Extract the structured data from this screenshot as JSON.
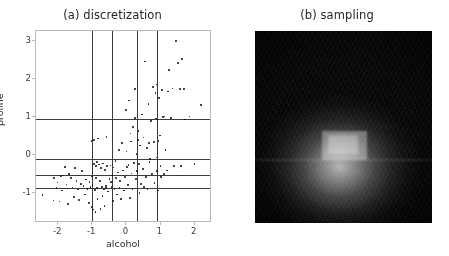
{
  "figure": {
    "width": 449,
    "height": 256,
    "background": "#ffffff"
  },
  "chart_data": [
    {
      "type": "scatter",
      "panel": "a",
      "title": "(a) discretization",
      "xlabel": "alcohol",
      "ylabel": "proline",
      "xlim": [
        -2.65,
        2.45
      ],
      "ylim": [
        -1.75,
        3.25
      ],
      "xticks": [
        -2,
        -1,
        0,
        1,
        2
      ],
      "xticklabels": [
        "-2",
        "-1",
        "0",
        "1",
        "2"
      ],
      "yticks": [
        -1,
        0,
        1,
        2,
        3
      ],
      "yticklabels": [
        "-1",
        "0",
        "1",
        "2",
        "3"
      ],
      "grid": false,
      "legend": null,
      "marker_color": "#111111",
      "marker_size": 1.8,
      "discretization_lines": {
        "vertical_x": [
          -1.0,
          -0.43,
          0.3,
          0.9
        ],
        "horizontal_y": [
          0.93,
          -0.13,
          -0.53,
          -0.87
        ],
        "color": "#3b3b3b"
      },
      "points": [
        [
          -2.46,
          -1.06
        ],
        [
          -2.14,
          -1.21
        ],
        [
          -2.12,
          -0.62
        ],
        [
          -2.05,
          -0.88
        ],
        [
          -2.02,
          -0.74
        ],
        [
          -1.96,
          -1.24
        ],
        [
          -1.92,
          -0.57
        ],
        [
          -1.88,
          -0.95
        ],
        [
          -1.84,
          -0.55
        ],
        [
          -1.8,
          -0.33
        ],
        [
          -1.76,
          -0.79
        ],
        [
          -1.72,
          -1.31
        ],
        [
          -1.68,
          -0.52
        ],
        [
          -1.62,
          -0.61
        ],
        [
          -1.58,
          -0.87
        ],
        [
          -1.54,
          -1.12
        ],
        [
          -1.5,
          -0.35
        ],
        [
          -1.46,
          -0.7
        ],
        [
          -1.42,
          -0.92
        ],
        [
          -1.38,
          -1.2
        ],
        [
          -1.34,
          -0.78
        ],
        [
          -1.3,
          -0.44
        ],
        [
          -1.26,
          -0.83
        ],
        [
          -1.22,
          -1.05
        ],
        [
          -1.18,
          -0.66
        ],
        [
          -1.14,
          -0.9
        ],
        [
          -1.1,
          -1.28
        ],
        [
          -1.08,
          -0.72
        ],
        [
          -1.05,
          -0.86
        ],
        [
          -1.02,
          -1.38
        ],
        [
          -1.0,
          -0.58
        ],
        [
          -0.99,
          -0.81
        ],
        [
          -0.98,
          -1.45
        ],
        [
          -0.96,
          0.38
        ],
        [
          -0.95,
          -0.25
        ],
        [
          -0.93,
          -0.94
        ],
        [
          -0.91,
          -1.52
        ],
        [
          -0.89,
          -0.3
        ],
        [
          -0.87,
          -0.88
        ],
        [
          -0.85,
          -1.18
        ],
        [
          -0.83,
          0.42
        ],
        [
          -0.8,
          -0.26
        ],
        [
          -0.78,
          -0.69
        ],
        [
          -0.76,
          -1.44
        ],
        [
          -0.74,
          -0.36
        ],
        [
          -0.72,
          -0.85
        ],
        [
          -0.7,
          -1.1
        ],
        [
          -0.68,
          -0.24
        ],
        [
          -0.66,
          -0.92
        ],
        [
          -0.64,
          -1.35
        ],
        [
          -0.62,
          -0.41
        ],
        [
          -0.6,
          -0.88
        ],
        [
          -0.58,
          0.46
        ],
        [
          -0.56,
          -0.31
        ],
        [
          -0.54,
          -0.97
        ],
        [
          -0.5,
          -0.64
        ],
        [
          -0.47,
          -0.29
        ],
        [
          -0.44,
          -0.86
        ],
        [
          -0.42,
          -0.55
        ],
        [
          -0.4,
          -1.22
        ],
        [
          -0.38,
          -0.34
        ],
        [
          -0.35,
          -0.92
        ],
        [
          -0.32,
          -0.18
        ],
        [
          -0.3,
          -0.62
        ],
        [
          -0.28,
          -1.05
        ],
        [
          -0.25,
          -0.47
        ],
        [
          -0.22,
          0.12
        ],
        [
          -0.2,
          -0.88
        ],
        [
          -0.18,
          -0.7
        ],
        [
          -0.15,
          -1.17
        ],
        [
          -0.12,
          0.3
        ],
        [
          -0.1,
          -0.42
        ],
        [
          -0.08,
          -0.95
        ],
        [
          -0.05,
          -0.6
        ],
        [
          -0.02,
          1.18
        ],
        [
          0.0,
          0.08
        ],
        [
          0.02,
          -0.33
        ],
        [
          0.05,
          -0.8
        ],
        [
          0.08,
          1.42
        ],
        [
          0.1,
          -1.15
        ],
        [
          0.12,
          0.55
        ],
        [
          0.15,
          -0.5
        ],
        [
          0.18,
          -0.92
        ],
        [
          0.2,
          0.72
        ],
        [
          0.22,
          -0.22
        ],
        [
          0.25,
          1.72
        ],
        [
          0.26,
          0.96
        ],
        [
          0.28,
          -0.65
        ],
        [
          0.3,
          0.02
        ],
        [
          0.32,
          -0.44
        ],
        [
          0.35,
          0.62
        ],
        [
          0.38,
          -1.02
        ],
        [
          0.4,
          0.24
        ],
        [
          0.42,
          -0.78
        ],
        [
          0.45,
          1.05
        ],
        [
          0.48,
          -0.38
        ],
        [
          0.5,
          0.45
        ],
        [
          0.55,
          2.45
        ],
        [
          0.58,
          -0.6
        ],
        [
          0.6,
          0.18
        ],
        [
          0.62,
          -0.9
        ],
        [
          0.65,
          1.32
        ],
        [
          0.68,
          -0.2
        ],
        [
          0.72,
          0.88
        ],
        [
          0.75,
          -0.52
        ],
        [
          0.78,
          1.78
        ],
        [
          0.8,
          0.33
        ],
        [
          0.82,
          -0.75
        ],
        [
          0.85,
          1.62
        ],
        [
          0.86,
          0.95
        ],
        [
          0.88,
          -0.08
        ],
        [
          0.9,
          1.84
        ],
        [
          0.9,
          -0.44
        ],
        [
          0.91,
          0.92
        ],
        [
          0.92,
          -0.95
        ],
        [
          0.95,
          1.48
        ],
        [
          0.98,
          0.5
        ],
        [
          1.0,
          -0.3
        ],
        [
          1.05,
          1.7
        ],
        [
          1.08,
          0.98
        ],
        [
          1.12,
          1.0
        ],
        [
          1.15,
          0.12
        ],
        [
          1.18,
          -0.42
        ],
        [
          1.22,
          1.66
        ],
        [
          1.25,
          2.22
        ],
        [
          1.3,
          0.96
        ],
        [
          1.35,
          1.74
        ],
        [
          1.4,
          -0.3
        ],
        [
          1.45,
          2.98
        ],
        [
          1.5,
          -0.55
        ],
        [
          1.52,
          2.4
        ],
        [
          1.58,
          1.72
        ],
        [
          1.6,
          -0.3
        ],
        [
          1.62,
          2.52
        ],
        [
          1.68,
          1.72
        ],
        [
          1.72,
          0.92
        ],
        [
          1.85,
          1.0
        ],
        [
          2.0,
          -0.25
        ],
        [
          2.18,
          1.3
        ],
        [
          2.32,
          0.92
        ],
        [
          -1.02,
          0.35
        ],
        [
          -0.9,
          -0.62
        ],
        [
          -0.86,
          -0.2
        ],
        [
          -0.6,
          -0.82
        ],
        [
          -0.46,
          -0.72
        ],
        [
          0.06,
          -0.28
        ],
        [
          0.14,
          0.34
        ],
        [
          0.33,
          0.38
        ],
        [
          0.36,
          -0.25
        ],
        [
          0.52,
          -0.86
        ],
        [
          0.66,
          0.3
        ],
        [
          0.7,
          -0.12
        ],
        [
          0.94,
          0.36
        ],
        [
          1.02,
          -0.6
        ],
        [
          1.1,
          -0.52
        ]
      ]
    },
    {
      "type": "heatmap",
      "panel": "b",
      "title": "(b) sampling",
      "xlabel": "",
      "ylabel": "",
      "colormap": "gray",
      "description": "2D density image, bright Gaussian blob centered slightly below middle with a sharp rectangular bright core and a horizontal discontinuity band",
      "background": "#050505",
      "peak_color": "#ffffff",
      "center_fraction": [
        0.48,
        0.6
      ]
    }
  ]
}
